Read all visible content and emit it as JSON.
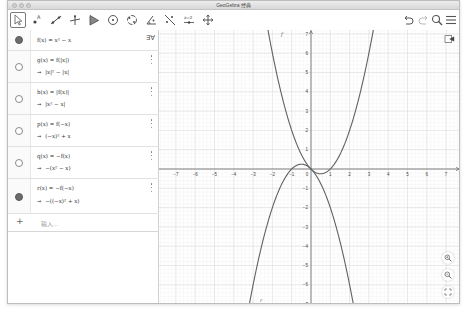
{
  "window": {
    "title": "GeoGebra 经典"
  },
  "toolbar": {
    "tools": [
      {
        "name": "move-tool",
        "selected": true
      },
      {
        "name": "point-tool"
      },
      {
        "name": "line-tool"
      },
      {
        "name": "perpendicular-line-tool"
      },
      {
        "name": "polygon-tool"
      },
      {
        "name": "circle-center-point-tool"
      },
      {
        "name": "circle-three-points-tool"
      },
      {
        "name": "angle-tool"
      },
      {
        "name": "reflect-tool"
      },
      {
        "name": "slider-tool",
        "label": "a=2"
      },
      {
        "name": "move-graphics-view-tool"
      }
    ],
    "right": [
      "undo-icon",
      "redo-icon",
      "search-icon",
      "menu-icon"
    ]
  },
  "algebra": {
    "sort_label": "∃∀",
    "items": [
      {
        "definition": "f(x) = x² − x",
        "result": "",
        "visible": true
      },
      {
        "definition": "g(x) = f(|x|)",
        "result": "|x|² − |x|",
        "visible": false
      },
      {
        "definition": "h(x) = |f(x)|",
        "result": "|x² − x|",
        "visible": false
      },
      {
        "definition": "p(x) = f(−x)",
        "result": "(−x)² + x",
        "visible": false
      },
      {
        "definition": "q(x) = −f(x)",
        "result": "−(x² − x)",
        "visible": false
      },
      {
        "definition": "r(x) = −f(−x)",
        "result": "−((−x)² + x)",
        "visible": true
      }
    ],
    "input_placeholder": "输入...",
    "arrow": "→"
  },
  "graphics": {
    "x_ticks": [
      "−7",
      "−6",
      "−5",
      "−4",
      "−3",
      "−2",
      "−1",
      "0",
      "1",
      "2",
      "3",
      "4",
      "5",
      "6",
      "7"
    ],
    "y_ticks_pos": [
      "1",
      "2",
      "3",
      "4",
      "5",
      "6",
      "7"
    ],
    "y_ticks_neg": [
      "−1",
      "−2",
      "−3",
      "−4",
      "−5",
      "−6",
      "−7"
    ],
    "curve_labels": {
      "f": "f",
      "r": "r"
    },
    "buttons": [
      "zoom-in-icon",
      "zoom-out-icon",
      "fullscreen-icon"
    ]
  },
  "chart_data": {
    "type": "line",
    "title": "",
    "xlabel": "",
    "ylabel": "",
    "xlim": [
      -7.8,
      7.8
    ],
    "ylim": [
      -7,
      7.2
    ],
    "grid": true,
    "series": [
      {
        "name": "f",
        "expression": "x^2 - x",
        "visible": true,
        "color": "#616161"
      },
      {
        "name": "r",
        "expression": "-x^2 - x",
        "visible": true,
        "color": "#616161"
      }
    ]
  }
}
